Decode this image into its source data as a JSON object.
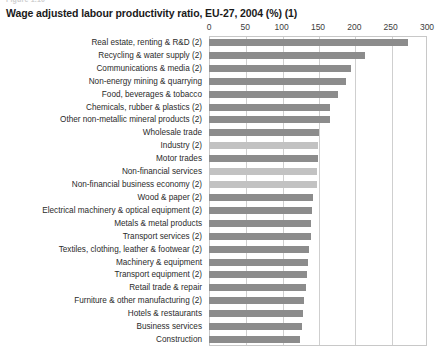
{
  "figure_stub": "Figure 1.10",
  "chart_data": {
    "type": "bar",
    "orientation": "horizontal",
    "title": "Wage adjusted labour productivity ratio, EU-27, 2004 (%) (1)",
    "xlabel": "",
    "ylabel": "",
    "xlim": [
      0,
      300
    ],
    "xticks": [
      0,
      50,
      100,
      150,
      200,
      250,
      300
    ],
    "xtick_labels": [
      "0",
      "50",
      "100",
      "150",
      "200",
      "250",
      "300"
    ],
    "grid": true,
    "legend": "none",
    "colors": {
      "bar_sector": "#8c8c8c",
      "bar_aggregate": "#c2c2c2",
      "gridline": "#cfcfcf",
      "plot_border": "#c8c8c8",
      "text": "#2b2b2b"
    },
    "categories": [
      "Real estate, renting & R&D (2)",
      "Recycling & water supply (2)",
      "Communications & media (2)",
      "Non-energy mining & quarrying",
      "Food, beverages & tobacco",
      "Chemicals, rubber & plastics (2)",
      "Other non-metallic mineral products (2)",
      "Wholesale trade",
      "Industry (2)",
      "Motor trades",
      "Non-financial services",
      "Non-financial business economy (2)",
      "Wood & paper (2)",
      "Electrical machinery & optical equipment (2)",
      "Metals & metal products",
      "Transport services (2)",
      "Textiles, clothing, leather & footwear (2)",
      "Machinery & equipment",
      "Transport equipment (2)",
      "Retail trade & repair",
      "Furniture & other manufacturing (2)",
      "Hotels & restaurants",
      "Business services",
      "Construction"
    ],
    "values": [
      274,
      214,
      196,
      188,
      178,
      167,
      166,
      152,
      150,
      150,
      149,
      148,
      143,
      142,
      141,
      141,
      138,
      136,
      135,
      133,
      131,
      130,
      128,
      125
    ],
    "series_kind": [
      "sector",
      "sector",
      "sector",
      "sector",
      "sector",
      "sector",
      "sector",
      "sector",
      "aggregate",
      "sector",
      "aggregate",
      "aggregate",
      "sector",
      "sector",
      "sector",
      "sector",
      "sector",
      "sector",
      "sector",
      "sector",
      "sector",
      "sector",
      "sector",
      "sector"
    ]
  }
}
